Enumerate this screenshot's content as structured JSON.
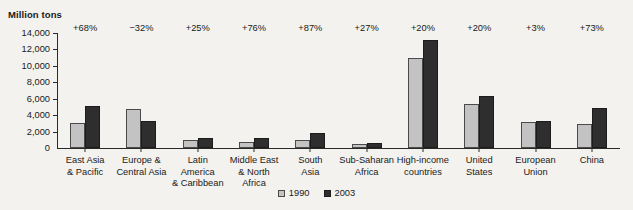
{
  "chart_data": {
    "type": "bar",
    "title": "",
    "subtitle": "",
    "xlabel": "",
    "ylabel": "Million tons",
    "ylim": [
      0,
      14000
    ],
    "ytick_labels": [
      "14,000",
      "12,000",
      "10,000",
      "8,000",
      "6,000",
      "4,000",
      "2,000",
      "0"
    ],
    "ytick_values": [
      14000,
      12000,
      10000,
      8000,
      6000,
      4000,
      2000,
      0
    ],
    "grid": false,
    "legend_position": "bottom-center",
    "categories": [
      "East Asia & Pacific",
      "Europe & Central Asia",
      "Latin America & Caribbean",
      "Middle East & North Africa",
      "South Asia",
      "Sub-Saharan Africa",
      "High-income countries",
      "United States",
      "European Union",
      "China"
    ],
    "category_lines": [
      [
        "East Asia",
        "& Pacific"
      ],
      [
        "Europe &",
        "Central Asia"
      ],
      [
        "Latin",
        "America",
        "& Caribbean"
      ],
      [
        "Middle East",
        "& North",
        "Africa"
      ],
      [
        "South",
        "Asia"
      ],
      [
        "Sub-Saharan",
        "Africa"
      ],
      [
        "High-income",
        "countries"
      ],
      [
        "United",
        "States"
      ],
      [
        "European",
        "Union"
      ],
      [
        "China"
      ]
    ],
    "series": [
      {
        "name": "1990",
        "color": "#c3c3c3",
        "values": [
          3000,
          4800,
          1000,
          700,
          1000,
          500,
          11000,
          5400,
          3200,
          2950
        ]
      },
      {
        "name": "2003",
        "color": "#2e2e2e",
        "values": [
          5150,
          3300,
          1250,
          1230,
          1870,
          620,
          13200,
          6300,
          3300,
          4900
        ]
      }
    ],
    "annotations": [
      "+68%",
      "−32%",
      "+25%",
      "+76%",
      "+87%",
      "+27%",
      "+20%",
      "+20%",
      "+3%",
      "+73%"
    ]
  }
}
